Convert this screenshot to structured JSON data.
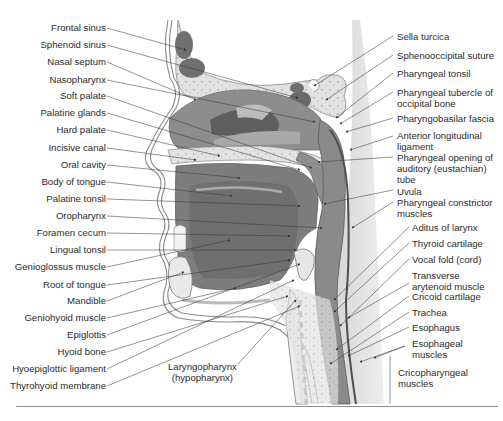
{
  "figure": {
    "colors": {
      "background": "#ffffff",
      "skin_outline": "#8a8a8a",
      "soft_tissue_light": "#dcdcdc",
      "muscle_mid": "#8c8c8c",
      "muscle_dark": "#6e6e6e",
      "cavity_dark": "#5f5f5f",
      "bone_speckle": "#c8c8c8",
      "leader_line": "#3a3a3a",
      "text": "#2b2b2b",
      "rule": "#8e8e8e"
    }
  },
  "labels_left": [
    {
      "text": "Frontal sinus",
      "y": 27
    },
    {
      "text": "Sphenoid sinus",
      "y": 44
    },
    {
      "text": "Nasal septum",
      "y": 61
    },
    {
      "text": "Nasopharynx",
      "y": 79
    },
    {
      "text": "Soft palate",
      "y": 95
    },
    {
      "text": "Palatine glands",
      "y": 112
    },
    {
      "text": "Hard palate",
      "y": 129
    },
    {
      "text": "Incisive canal",
      "y": 147
    },
    {
      "text": "Oral cavity",
      "y": 164
    },
    {
      "text": "Body of tongue",
      "y": 181
    },
    {
      "text": "Palatine tonsil",
      "y": 198
    },
    {
      "text": "Oropharynx",
      "y": 215
    },
    {
      "text": "Foramen cecum",
      "y": 232
    },
    {
      "text": "Lingual tonsil",
      "y": 249
    },
    {
      "text": "Genioglossus muscle",
      "y": 266
    },
    {
      "text": "Root of tongue",
      "y": 284
    },
    {
      "text": "Mandible",
      "y": 300
    },
    {
      "text": "Geniohyoid muscle",
      "y": 317
    },
    {
      "text": "Epiglottis",
      "y": 334
    },
    {
      "text": "Hyoid bone",
      "y": 351
    },
    {
      "text": "Hyoepiglottic ligament",
      "y": 368
    },
    {
      "text": "Thyrohyoid membrane",
      "y": 385
    }
  ],
  "labels_right": [
    {
      "text": "Sella turcica",
      "x": 395,
      "y": 32
    },
    {
      "text": "Sphenooccipital suture",
      "x": 395,
      "y": 51
    },
    {
      "text": "Pharyngeal tonsil",
      "x": 395,
      "y": 69
    },
    {
      "text": "Pharyngeal tubercle of occipital bone",
      "x": 395,
      "y": 88,
      "lines": [
        "Pharyngeal tubercle of",
        "occipital bone"
      ]
    },
    {
      "text": "Pharyngobasilar fascia",
      "x": 395,
      "y": 115
    },
    {
      "text": "Anterior longitudinal ligament",
      "x": 395,
      "y": 131,
      "lines": [
        "Anterior longitudinal",
        "ligament"
      ]
    },
    {
      "text": "Pharyngeal opening of auditory (eustachian) tube",
      "x": 395,
      "y": 153,
      "lines": [
        "Pharyngeal opening of",
        "auditory (eustachian)",
        "tube"
      ]
    },
    {
      "text": "Uvula",
      "x": 395,
      "y": 186
    },
    {
      "text": "Pharyngeal constrictor muscles",
      "x": 395,
      "y": 198,
      "lines": [
        "Pharyngeal constrictor",
        "muscles"
      ]
    },
    {
      "text": "Aditus of larynx",
      "x": 411,
      "y": 223
    },
    {
      "text": "Thyroid cartilage",
      "x": 411,
      "y": 239
    },
    {
      "text": "Vocal fold (cord)",
      "x": 411,
      "y": 255
    },
    {
      "text": "Transverse arytenoid muscle",
      "x": 411,
      "y": 271,
      "lines": [
        "Transverse",
        "arytenoid muscle"
      ]
    },
    {
      "text": "Cricoid cartilage",
      "x": 411,
      "y": 292
    },
    {
      "text": "Trachea",
      "x": 411,
      "y": 308
    },
    {
      "text": "Esophagus",
      "x": 411,
      "y": 323
    },
    {
      "text": "Esophageal muscles",
      "x": 411,
      "y": 339,
      "lines": [
        "Esophageal",
        "muscles"
      ]
    },
    {
      "text": "Cricopharyngeal muscles",
      "x": 397,
      "y": 368,
      "lines": [
        "Cricopharyngeal",
        "muscles"
      ]
    }
  ],
  "labels_center": [
    {
      "text": "Laryngopharynx (hypopharynx)",
      "x": 166,
      "y": 362,
      "lines": [
        "Laryngopharynx",
        "(hypopharynx)"
      ]
    }
  ]
}
